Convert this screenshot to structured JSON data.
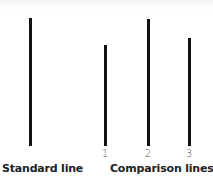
{
  "diagram": {
    "standard": {
      "label": "Standard line",
      "length_px": 128
    },
    "comparison": {
      "label": "Comparison lines",
      "lines": [
        {
          "number": "1",
          "length_px": 101
        },
        {
          "number": "2",
          "length_px": 127
        },
        {
          "number": "3",
          "length_px": 108
        }
      ]
    },
    "colors": {
      "line": "#111111",
      "text": "#222222",
      "number": "#555555",
      "background": "#ffffff"
    }
  }
}
